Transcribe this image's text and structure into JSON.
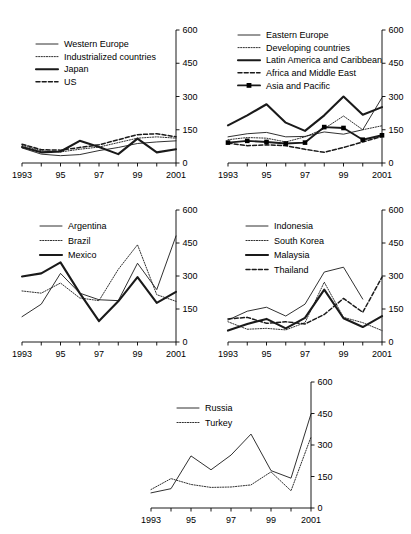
{
  "figure": {
    "type": "multi-panel-line-chart",
    "panel_count": 5,
    "shared_x_categories": [
      "1993",
      "1994",
      "1995",
      "1996",
      "1997",
      "1998",
      "1999",
      "2000",
      "2001"
    ],
    "shared_x_tick_labels": [
      "1993",
      "",
      "95",
      "",
      "97",
      "",
      "99",
      "",
      "2001"
    ],
    "shared_y_ticks": [
      "0",
      "150",
      "300",
      "450",
      "600"
    ],
    "y_axis_position": "right",
    "y_range": [
      0,
      600
    ],
    "grid": "off"
  },
  "chart_data": [
    {
      "id": "panel-industrialized",
      "type": "line",
      "title": "",
      "xlabel": "",
      "ylabel": "",
      "ylim": [
        0,
        600
      ],
      "yticks": [
        0,
        150,
        300,
        450,
        600
      ],
      "ytick_labels": [
        "0",
        "150",
        "300",
        "450",
        "600"
      ],
      "categories": [
        "1993",
        "1994",
        "1995",
        "1996",
        "1997",
        "1998",
        "1999",
        "2000",
        "2001"
      ],
      "xtick_labels": [
        "1993",
        "",
        "95",
        "",
        "97",
        "",
        "99",
        "",
        "2001"
      ],
      "legend_position": "upper-left",
      "series": [
        {
          "name": "Western Europe",
          "style": "thin-solid",
          "values": [
            68,
            40,
            33,
            38,
            56,
            70,
            88,
            95,
            100
          ]
        },
        {
          "name": "Industrialized countries",
          "style": "dotted",
          "values": [
            80,
            55,
            50,
            62,
            72,
            92,
            112,
            118,
            112
          ]
        },
        {
          "name": "Japan",
          "style": "thick-solid",
          "values": [
            72,
            48,
            52,
            100,
            72,
            40,
            110,
            48,
            62
          ]
        },
        {
          "name": "US",
          "style": "dashed",
          "values": [
            85,
            60,
            58,
            70,
            82,
            105,
            128,
            132,
            118
          ]
        }
      ]
    },
    {
      "id": "panel-emerging-regions",
      "type": "line",
      "title": "",
      "xlabel": "",
      "ylabel": "",
      "ylim": [
        0,
        600
      ],
      "yticks": [
        0,
        150,
        300,
        450,
        600
      ],
      "ytick_labels": [
        "0",
        "150",
        "300",
        "450",
        "600"
      ],
      "categories": [
        "1993",
        "1994",
        "1995",
        "1996",
        "1997",
        "1998",
        "1999",
        "2000",
        "2001"
      ],
      "xtick_labels": [
        "1993",
        "",
        "95",
        "",
        "97",
        "",
        "99",
        "",
        "2001"
      ],
      "legend_position": "upper-left",
      "series": [
        {
          "name": "Eastern Europe",
          "style": "thin-solid",
          "values": [
            118,
            132,
            138,
            118,
            120,
            140,
            130,
            150,
            295
          ]
        },
        {
          "name": "Developing countries",
          "style": "dotted",
          "values": [
            105,
            115,
            112,
            95,
            118,
            155,
            212,
            150,
            168
          ]
        },
        {
          "name": "Latin America and Caribbean",
          "style": "thick-solid",
          "values": [
            170,
            215,
            265,
            182,
            145,
            215,
            300,
            218,
            252
          ]
        },
        {
          "name": "Africa and Middle East",
          "style": "dashed",
          "values": [
            90,
            78,
            82,
            78,
            62,
            48,
            70,
            95,
            120
          ]
        },
        {
          "name": "Asia and Pacific",
          "style": "thick-solid-square-markers",
          "values": [
            92,
            100,
            95,
            88,
            92,
            162,
            158,
            105,
            125
          ]
        }
      ]
    },
    {
      "id": "panel-latin-america",
      "type": "line",
      "title": "",
      "xlabel": "",
      "ylabel": "",
      "ylim": [
        0,
        600
      ],
      "yticks": [
        0,
        150,
        300,
        450,
        600
      ],
      "ytick_labels": [
        "0",
        "150",
        "300",
        "450",
        "600"
      ],
      "categories": [
        "1993",
        "1994",
        "1995",
        "1996",
        "1997",
        "1998",
        "1999",
        "2000",
        "2001"
      ],
      "xtick_labels": [
        "1993",
        "",
        "95",
        "",
        "97",
        "",
        "99",
        "",
        "2001"
      ],
      "legend_position": "upper-left",
      "series": [
        {
          "name": "Argentina",
          "style": "thin-solid",
          "values": [
            115,
            172,
            312,
            222,
            192,
            188,
            358,
            238,
            482
          ]
        },
        {
          "name": "Brazil",
          "style": "dotted",
          "values": [
            232,
            222,
            268,
            200,
            188,
            330,
            442,
            215,
            185
          ]
        },
        {
          "name": "Mexico",
          "style": "thick-solid",
          "values": [
            298,
            312,
            362,
            222,
            95,
            185,
            295,
            178,
            228
          ]
        }
      ]
    },
    {
      "id": "panel-asia",
      "type": "line",
      "title": "",
      "xlabel": "",
      "ylabel": "",
      "ylim": [
        0,
        600
      ],
      "yticks": [
        0,
        150,
        300,
        450,
        600
      ],
      "ytick_labels": [
        "0",
        "150",
        "300",
        "450",
        "600"
      ],
      "categories": [
        "1993",
        "1994",
        "1995",
        "1996",
        "1997",
        "1998",
        "1999",
        "2000",
        "2001"
      ],
      "xtick_labels": [
        "1993",
        "",
        "95",
        "",
        "97",
        "",
        "99",
        "",
        "2001"
      ],
      "legend_position": "upper-left",
      "series": [
        {
          "name": "Indonesia",
          "style": "thin-solid",
          "values": [
            100,
            140,
            158,
            118,
            172,
            318,
            340,
            195,
            0
          ]
        },
        {
          "name": "South Korea",
          "style": "dotted",
          "values": [
            92,
            58,
            62,
            55,
            88,
            272,
            112,
            88,
            52
          ]
        },
        {
          "name": "Malaysia",
          "style": "thick-solid",
          "values": [
            52,
            82,
            105,
            62,
            110,
            238,
            108,
            68,
            118
          ]
        },
        {
          "name": "Thailand",
          "style": "dashed",
          "values": [
            105,
            112,
            85,
            92,
            82,
            125,
            198,
            135,
            295
          ]
        }
      ]
    },
    {
      "id": "panel-russia-turkey",
      "type": "line",
      "title": "",
      "xlabel": "",
      "ylabel": "",
      "ylim": [
        0,
        600
      ],
      "yticks": [
        0,
        150,
        300,
        450,
        600
      ],
      "ytick_labels": [
        "0",
        "150",
        "300",
        "450",
        "600"
      ],
      "categories": [
        "1993",
        "1994",
        "1995",
        "1996",
        "1997",
        "1998",
        "1999",
        "2000",
        "2001"
      ],
      "xtick_labels": [
        "1993",
        "",
        "95",
        "",
        "97",
        "",
        "99",
        "",
        "2001"
      ],
      "legend_position": "upper-left",
      "series": [
        {
          "name": "Russia",
          "style": "thin-solid",
          "values": [
            72,
            92,
            248,
            182,
            252,
            352,
            178,
            142,
            448
          ]
        },
        {
          "name": "Turkey",
          "style": "dotted",
          "values": [
            88,
            140,
            112,
            98,
            100,
            110,
            172,
            82,
            338
          ]
        }
      ]
    }
  ],
  "panels": [
    {
      "legend": [
        {
          "label": "Western Europe",
          "style": "thin-solid"
        },
        {
          "label": "Industrialized countries",
          "style": "dotted"
        },
        {
          "label": "Japan",
          "style": "thick-solid"
        },
        {
          "label": "US",
          "style": "dashed"
        }
      ]
    },
    {
      "legend": [
        {
          "label": "Eastern Europe",
          "style": "thin-solid"
        },
        {
          "label": "Developing countries",
          "style": "dotted"
        },
        {
          "label": "Latin America and Caribbean",
          "style": "thick-solid"
        },
        {
          "label": "Africa and Middle East",
          "style": "dashed"
        },
        {
          "label": "Asia and Pacific",
          "style": "thick-solid-square-markers"
        }
      ]
    },
    {
      "legend": [
        {
          "label": "Argentina",
          "style": "thin-solid"
        },
        {
          "label": "Brazil",
          "style": "dotted"
        },
        {
          "label": "Mexico",
          "style": "thick-solid"
        }
      ]
    },
    {
      "legend": [
        {
          "label": "Indonesia",
          "style": "thin-solid"
        },
        {
          "label": "South Korea",
          "style": "dotted"
        },
        {
          "label": "Malaysia",
          "style": "thick-solid"
        },
        {
          "label": "Thailand",
          "style": "dashed"
        }
      ]
    },
    {
      "legend": [
        {
          "label": "Russia",
          "style": "thin-solid"
        },
        {
          "label": "Turkey",
          "style": "dotted"
        }
      ]
    }
  ]
}
